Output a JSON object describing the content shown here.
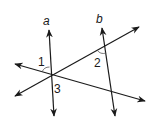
{
  "diagram": {
    "line_labels": {
      "a": "a",
      "b": "b"
    },
    "angle_labels": {
      "one": "1",
      "two": "2",
      "three": "3"
    },
    "colors": {
      "stroke": "#1a1a1a",
      "background": "#ffffff"
    }
  }
}
